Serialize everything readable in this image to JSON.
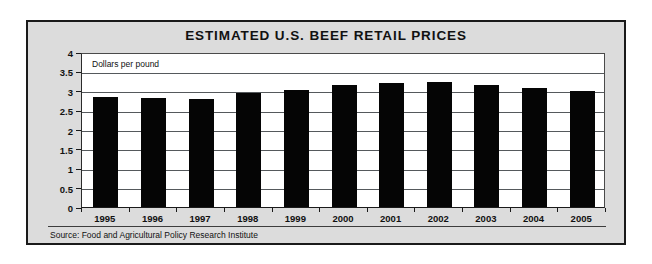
{
  "chart_data": {
    "type": "bar",
    "title": "ESTIMATED U.S. BEEF RETAIL PRICES",
    "subtitle": "",
    "xlabel": "",
    "ylabel": "Dollars per pound",
    "annotation": "Dollars per pound",
    "source": "Source: Food and Agricultural Policy Research Institute",
    "categories": [
      "1995",
      "1996",
      "1997",
      "1998",
      "1999",
      "2000",
      "2001",
      "2002",
      "2003",
      "2004",
      "2005"
    ],
    "values": [
      2.85,
      2.81,
      2.78,
      2.93,
      3.02,
      3.14,
      3.2,
      3.22,
      3.16,
      3.07,
      3.0
    ],
    "ylim": [
      0,
      4
    ],
    "yticks": [
      "0",
      "0.5",
      "1",
      "1.5",
      "2",
      "2.5",
      "3",
      "3.5",
      "4"
    ],
    "ytick_values": [
      0,
      0.5,
      1,
      1.5,
      2,
      2.5,
      3,
      3.5,
      4
    ],
    "grid": true,
    "legend": false,
    "legend_position": "none",
    "series_color": "#050505",
    "background_color": "#dcdcdc",
    "plot_background_color": "#ffffff",
    "gridline_color": "#55595c"
  }
}
